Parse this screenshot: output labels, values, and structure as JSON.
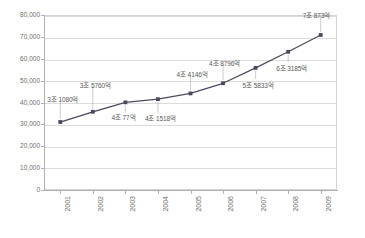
{
  "chart_data": {
    "type": "line",
    "title": "",
    "subtitle": "",
    "xlabel": "",
    "ylabel": "",
    "categories": [
      "2001",
      "2002",
      "2003",
      "2004",
      "2005",
      "2006",
      "2007",
      "2008",
      "2009"
    ],
    "values": [
      31080,
      35760,
      40077,
      41518,
      44146,
      48796,
      55833,
      63185,
      70873
    ],
    "point_labels": [
      "3조 1080억",
      "3조 5760억",
      "4조 77억",
      "4조 1518억",
      "4조 4146억",
      "4조 8796억",
      "5조 5833억",
      "6조 3185억",
      "7조 873억"
    ],
    "ylim": [
      0,
      80000
    ],
    "ytick_labels": [
      "80,000",
      "70,000",
      "60,000",
      "50,000",
      "40,000",
      "30,000",
      "20,000",
      "10,000",
      "0"
    ],
    "ytick_values": [
      80000,
      70000,
      60000,
      50000,
      40000,
      30000,
      20000,
      10000,
      0
    ],
    "grid": true,
    "legend": false,
    "legend_position": "none",
    "series": [
      {
        "name": "",
        "values": [
          31080,
          35760,
          40077,
          41518,
          44146,
          48796,
          55833,
          63185,
          70873
        ]
      }
    ],
    "colors": {
      "line": "#4a4a5e",
      "marker": "#4a4a5e",
      "grid": "#dcdcdc",
      "axis": "#b0b0b0",
      "label_text": "#5a5a5a",
      "tick_text": "#6d6d6d",
      "background": "#ffffff"
    }
  }
}
